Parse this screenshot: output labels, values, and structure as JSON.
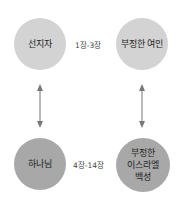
{
  "diagram": {
    "nodes": [
      {
        "id": "prophet",
        "label": "선지자",
        "color": "#d3d3d3"
      },
      {
        "id": "unfaithful-woman",
        "label": "부정한 여인",
        "color": "#d3d3d3"
      },
      {
        "id": "god",
        "label": "하나님",
        "color": "#a8a8a8"
      },
      {
        "id": "unfaithful-israel",
        "label": "부정한\n이스라엘\n백성",
        "label_lines": [
          "부정한",
          "이스라엘",
          "백성"
        ],
        "color": "#a8a8a8"
      }
    ],
    "edges": [
      {
        "from": "prophet",
        "to": "unfaithful-woman",
        "label": "1장-3장"
      },
      {
        "from": "god",
        "to": "unfaithful-israel",
        "label": "4장-14장"
      },
      {
        "from": "prophet",
        "to": "god",
        "type": "double-arrow"
      },
      {
        "from": "unfaithful-woman",
        "to": "unfaithful-israel",
        "type": "double-arrow"
      }
    ],
    "arrow_color": "#777777"
  }
}
